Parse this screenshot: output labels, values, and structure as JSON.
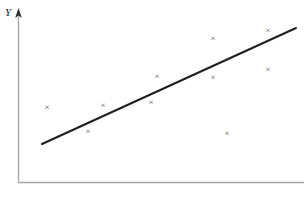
{
  "figure": {
    "background_color": "#ffffff",
    "width": 304,
    "height": 199
  },
  "chart_data": {
    "type": "scatter",
    "title": "",
    "subtitle": "",
    "xlabel": "",
    "ylabel": "Y",
    "grid": false,
    "legend": null,
    "axis_style": {
      "y_axis_arrow": true,
      "x_axis_arrow": false,
      "axis_color": "#a8a8a8",
      "tick_labels": false
    },
    "marker": {
      "symbol": "×",
      "color": "#555555",
      "size_px": 9
    },
    "points": [
      {
        "px": 47,
        "py": 107
      },
      {
        "px": 88,
        "py": 131
      },
      {
        "px": 103,
        "py": 105
      },
      {
        "px": 151,
        "py": 102
      },
      {
        "px": 157,
        "py": 76
      },
      {
        "px": 213,
        "py": 38
      },
      {
        "px": 213,
        "py": 77
      },
      {
        "px": 268,
        "py": 30
      },
      {
        "px": 268,
        "py": 69
      },
      {
        "px": 227,
        "py": 133
      }
    ],
    "trendline": {
      "label": "",
      "color": "#1f1f1f",
      "width_px": 2,
      "x1": 42,
      "y1": 144,
      "x2": 296,
      "y2": 28
    },
    "xlim": [
      0,
      1
    ],
    "ylim": [
      0,
      1
    ]
  },
  "axes": {
    "y_axis": {
      "x": 18,
      "y_top": 12,
      "y_bottom": 182
    },
    "x_axis": {
      "y": 182,
      "x_left": 18,
      "x_right": 304
    },
    "y_label_text": "Y"
  }
}
